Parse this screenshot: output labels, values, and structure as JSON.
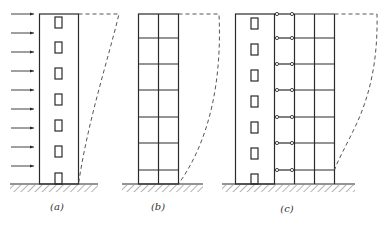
{
  "figure": {
    "panels": [
      {
        "id": "a",
        "label": "(a)",
        "system": "shear wall",
        "deformation": "bending-type (flexural)"
      },
      {
        "id": "b",
        "label": "(b)",
        "system": "frame",
        "deformation": "shear-type"
      },
      {
        "id": "c",
        "label": "(c)",
        "system": "frame-shear wall with pinned links",
        "deformation": "combined (bending-shear)"
      }
    ],
    "load_arrows_count": 9,
    "stories": 7,
    "colors": {
      "line": "#2a2a2a",
      "dashed": "#555555",
      "background": "#ffffff"
    }
  }
}
